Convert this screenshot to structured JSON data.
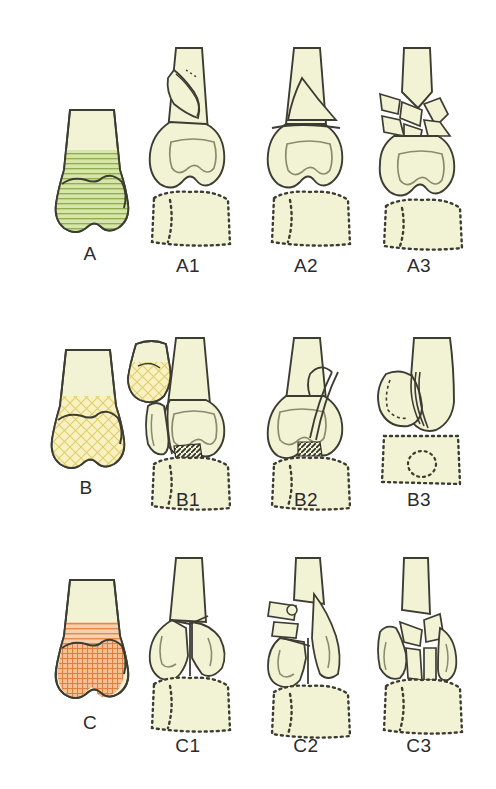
{
  "figure": {
    "background_color": "#ffffff",
    "rows": [
      {
        "id": "row-A",
        "group_label": "A",
        "group_color_name": "green",
        "group_color": "#b9d17c",
        "hatch": "horizontal",
        "region_description": "extra-articular metaphyseal zone shaded green",
        "panels": [
          {
            "label": "A1",
            "description": "extra-articular avulsion fracture of lateral epicondyle"
          },
          {
            "label": "A2",
            "description": "extra-articular simple metaphyseal fracture"
          },
          {
            "label": "A3",
            "description": "extra-articular multifragmentary metaphyseal fracture"
          }
        ]
      },
      {
        "id": "row-B",
        "group_label": "B",
        "group_color_name": "yellow",
        "group_color": "#f0e08a",
        "hatch": "cross-diagonal",
        "region_description": "partial articular condylar zone shaded yellow with detached fragment",
        "panels": [
          {
            "label": "B1",
            "description": "partial articular lateral sagittal fracture"
          },
          {
            "label": "B2",
            "description": "partial articular medial sagittal fracture"
          },
          {
            "label": "B3",
            "description": "partial articular frontal plane (capitellum) fracture"
          }
        ]
      },
      {
        "id": "row-C",
        "group_label": "C",
        "group_color_name": "orange",
        "group_color": "#f0a46a",
        "hatch": "grid",
        "region_description": "complete articular zone shaded orange",
        "panels": [
          {
            "label": "C1",
            "description": "complete articular simple articular and simple metaphyseal fracture"
          },
          {
            "label": "C2",
            "description": "complete articular simple articular and multifragmentary metaphyseal fracture"
          },
          {
            "label": "C3",
            "description": "complete articular multifragmentary articular fracture"
          }
        ]
      }
    ],
    "palette": {
      "bone_fill": "#f2f2d4",
      "bone_outline": "#3c3c32",
      "inner_line": "#8a8a6e",
      "dotted_outline": "#3c3c32",
      "caption_color": "#2b2b2b",
      "green_shade": "#b9d17c",
      "green_line": "#8fae52",
      "yellow_shade": "#f6edaa",
      "yellow_line": "#ddc75c",
      "orange_shade": "#f3ab74",
      "orange_line": "#d97c3c"
    }
  }
}
